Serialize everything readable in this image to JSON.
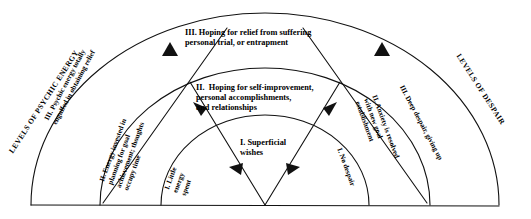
{
  "diagram": {
    "type": "semicircular-fan",
    "title_left": "LEVELS OF PSYCHIC ENERGY",
    "title_right": "LEVELS OF DESPAIR",
    "stroke_color": "#111111",
    "background_color": "#ffffff",
    "center_wedge": {
      "bands": [
        {
          "level": "I",
          "text": "I. Superficial\nwishes"
        },
        {
          "level": "II",
          "text": "II.  Hoping for self-improvement,\npersonal accomplishments,\nand relationships"
        },
        {
          "level": "III",
          "text": "III. Hoping for relief from suffering\npersonal trial, or entrapment"
        }
      ]
    },
    "left_sector": {
      "heading": "LEVELS OF PSYCHIC ENERGY",
      "bands": [
        {
          "level": "I",
          "text": "I. Little\nenergy\nspent"
        },
        {
          "level": "II",
          "text": "II. Energy invested in\nplanning for goal\nachievement; thoughts\noccupy time"
        },
        {
          "level": "III",
          "text": "III. Psychic energy totally\nengulfed in obtaining relief"
        }
      ]
    },
    "right_sector": {
      "heading": "LEVELS OF DESPAIR",
      "bands": [
        {
          "level": "I",
          "text": "I. No despair"
        },
        {
          "level": "II",
          "text": "II. Anxiety is resolved\nwith new goal\nestablishment"
        },
        {
          "level": "III",
          "text": "III. Deep despair, giving up"
        }
      ]
    },
    "arrowheads": [
      {
        "name": "arrow-core-left",
        "direction": "left"
      },
      {
        "name": "arrow-core-right",
        "direction": "right"
      },
      {
        "name": "arrow-band2-left",
        "direction": "up-left"
      },
      {
        "name": "arrow-band2-right",
        "direction": "up-right"
      },
      {
        "name": "arrow-band3-left",
        "direction": "up"
      },
      {
        "name": "arrow-band3-right",
        "direction": "up-left"
      }
    ]
  }
}
